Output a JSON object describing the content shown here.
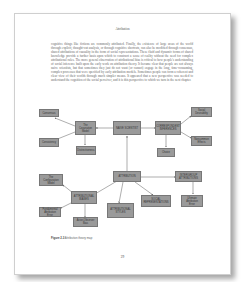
{
  "page": {
    "running_head": "Attribution",
    "body_text": "cognitive things like fictions are commonly attributed. Finally, the existence of large areas of the world through explicit, thought-out analysis, or through cognitive shortcuts, can also be modified through consensus, shared attributions of causality in the form of social representations. These fluid and dynamic forms of shared knowledge provide a further basis upon which to construct a sense of reality without the need for complex attributional rules. The more general observation of attributional bias is critical to how people's understanding of social inference built upon the early work on attribution theory. It became clear that people are not always naive scientists, but that sometimes they just do not want (or cannot) engage in the long, time-consuming, complex processes that were specified by early attribution models. Sometimes people can form a coherent and clear view of their worlds through much simpler means. It appeared that a new perspective was needed to understand the cognition of the social perceiver, and it is this perspective to which we turn in the next chapter.",
    "page_number": "29"
  },
  "diagram": {
    "boxes": {
      "consensus": "Consensus",
      "consistency": "Consistency",
      "covariation": "The Covariation Model",
      "distinctiveness": "Distinctiveness",
      "naive": "NAIVE SCIENTIST",
      "correspondent": "CORRESPONDENT INFERENCES",
      "social_desirability": "Social Desirability",
      "noncommon": "Noncommon Effects",
      "choice": "Choice",
      "configuration": "The Configuration Model",
      "attribution": "ATTRIBUTION",
      "attributional_styles": "ATTRIBUTIONAL STYLES",
      "attribution_biases": "ATTRIBUTIONAL BIASES",
      "fundamental": "Fundamental Attribution Error",
      "actor_observer": "Actor-Observer Bias",
      "depressive": "Depressive Attributional Style",
      "intergroup": "INTERGROUP ATTRIBUTIONS",
      "social_representations": "SOCIAL REPRESENTATIONS",
      "ultimate": "Ultimate Attribution Error"
    },
    "caption_label": "Figure 2.3",
    "caption_text": "Attribution theory map"
  }
}
